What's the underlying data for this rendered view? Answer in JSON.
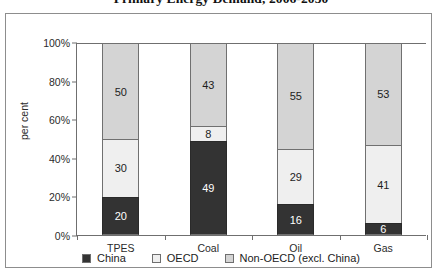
{
  "chart_data": {
    "type": "bar",
    "subtype": "stacked-100-percent",
    "title": "Primary Energy Demand, 2006-2030",
    "xlabel": "",
    "ylabel": "per cent",
    "ylim": [
      0,
      100
    ],
    "ytick_labels": [
      "0%",
      "20%",
      "40%",
      "60%",
      "80%",
      "100%"
    ],
    "ytick_values": [
      0,
      20,
      40,
      60,
      80,
      100
    ],
    "grid": false,
    "legend_position": "bottom",
    "categories": [
      "TPES",
      "Coal",
      "Oil",
      "Gas"
    ],
    "series": [
      {
        "name": "China",
        "color": "#333333",
        "values": [
          20,
          49,
          16,
          6
        ]
      },
      {
        "name": "OECD",
        "color": "#efefef",
        "values": [
          30,
          8,
          29,
          41
        ]
      },
      {
        "name": "Non-OECD (excl. China)",
        "color": "#d4d4d4",
        "values": [
          50,
          43,
          55,
          53
        ]
      }
    ]
  },
  "axis": {
    "y_label": "per cent",
    "y_ticks": [
      {
        "label": "100%",
        "value": 100
      },
      {
        "label": "80%",
        "value": 80
      },
      {
        "label": "60%",
        "value": 60
      },
      {
        "label": "40%",
        "value": 40
      },
      {
        "label": "20%",
        "value": 20
      },
      {
        "label": "0%",
        "value": 0
      }
    ],
    "x_categories": [
      "TPES",
      "Coal",
      "Oil",
      "Gas"
    ]
  },
  "bars": [
    {
      "category": "TPES",
      "segments": [
        {
          "series": "Non-OECD (excl. China)",
          "value": 50,
          "label": "50"
        },
        {
          "series": "OECD",
          "value": 30,
          "label": "30"
        },
        {
          "series": "China",
          "value": 20,
          "label": "20"
        }
      ]
    },
    {
      "category": "Coal",
      "segments": [
        {
          "series": "Non-OECD (excl. China)",
          "value": 43,
          "label": "43"
        },
        {
          "series": "OECD",
          "value": 8,
          "label": "8"
        },
        {
          "series": "China",
          "value": 49,
          "label": "49"
        }
      ]
    },
    {
      "category": "Oil",
      "segments": [
        {
          "series": "Non-OECD (excl. China)",
          "value": 55,
          "label": "55"
        },
        {
          "series": "OECD",
          "value": 29,
          "label": "29"
        },
        {
          "series": "China",
          "value": 16,
          "label": "16"
        }
      ]
    },
    {
      "category": "Gas",
      "segments": [
        {
          "series": "Non-OECD (excl. China)",
          "value": 53,
          "label": "53"
        },
        {
          "series": "OECD",
          "value": 41,
          "label": "41"
        },
        {
          "series": "China",
          "value": 6,
          "label": "6"
        }
      ]
    }
  ],
  "legend": {
    "items": [
      {
        "label": "China",
        "color": "#333333"
      },
      {
        "label": "OECD",
        "color": "#efefef"
      },
      {
        "label": "Non-OECD (excl. China)",
        "color": "#d4d4d4"
      }
    ]
  },
  "colors": {
    "china": "#333333",
    "oecd": "#efefef",
    "non_oecd": "#d4d4d4",
    "axis": "#6f6f6f",
    "frame": "#8d8d8d"
  }
}
